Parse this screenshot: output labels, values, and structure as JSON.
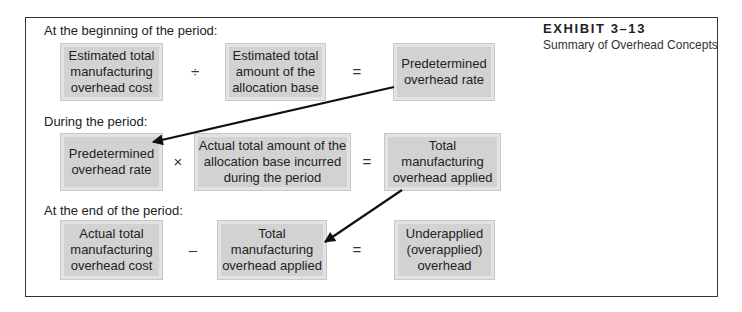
{
  "exhibit": {
    "number": "EXHIBIT 3–13",
    "title": "Summary of Overhead Concepts"
  },
  "sections": [
    {
      "label": "At the beginning of the period:",
      "terms": [
        "Estimated total manufacturing overhead cost",
        "Estimated total amount of the allocation base",
        "Predetermined overhead rate"
      ],
      "term_lines": [
        [
          "Estimated total",
          "manufacturing",
          "overhead cost"
        ],
        [
          "Estimated total",
          "amount of the",
          "allocation base"
        ],
        [
          "Predetermined",
          "overhead rate"
        ]
      ],
      "operators": [
        "÷",
        "="
      ]
    },
    {
      "label": "During the period:",
      "terms": [
        "Predetermined overhead rate",
        "Actual total amount of the allocation base incurred during the period",
        "Total manufacturing overhead applied"
      ],
      "term_lines": [
        [
          "Predetermined",
          "overhead rate"
        ],
        [
          "Actual total amount of the",
          "allocation base incurred",
          "during the period"
        ],
        [
          "Total",
          "manufacturing",
          "overhead applied"
        ]
      ],
      "operators": [
        "×",
        "="
      ]
    },
    {
      "label": "At the end of the period:",
      "terms": [
        "Actual total manufacturing overhead cost",
        "Total manufacturing overhead applied",
        "Underapplied (overapplied) overhead"
      ],
      "term_lines": [
        [
          "Actual total",
          "manufacturing",
          "overhead cost"
        ],
        [
          "Total",
          "manufacturing",
          "overhead applied"
        ],
        [
          "Underapplied",
          "(overapplied)",
          "overhead"
        ]
      ],
      "operators": [
        "–",
        "="
      ]
    }
  ],
  "arrows": [
    {
      "from": "Predetermined overhead rate (beginning)",
      "to": "Predetermined overhead rate (during)"
    },
    {
      "from": "Total manufacturing overhead applied (during)",
      "to": "Total manufacturing overhead applied (end)"
    }
  ],
  "colors": {
    "box_fill": "#d2d2d2",
    "box_border": "#e3e3e3",
    "frame": "#333333",
    "arrow": "#111111"
  }
}
